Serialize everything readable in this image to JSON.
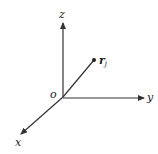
{
  "diagram": {
    "type": "3d-coordinate-axes",
    "colors": {
      "line": "#333333",
      "text": "#222222",
      "background": "#ffffff"
    },
    "origin": {
      "label": "o",
      "x": 63,
      "y": 97
    },
    "axes": [
      {
        "name": "z",
        "label": "z",
        "tip": {
          "x": 63,
          "y": 22
        }
      },
      {
        "name": "y",
        "label": "y",
        "tip": {
          "x": 145,
          "y": 98
        }
      },
      {
        "name": "x",
        "label": "x",
        "tip": {
          "x": 20,
          "y": 135
        }
      }
    ],
    "vector": {
      "label": "r",
      "subscript": "j",
      "end": {
        "x": 94,
        "y": 60
      }
    }
  }
}
